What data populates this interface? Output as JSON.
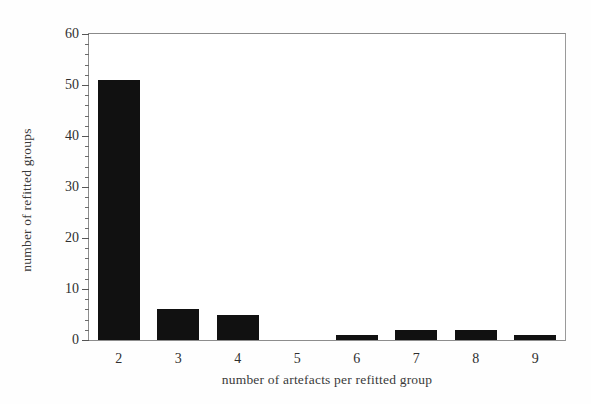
{
  "chart_data": {
    "type": "bar",
    "title": "",
    "subtitle": "",
    "xlabel": "number of artefacts per refitted group",
    "ylabel": "number of refitted groups",
    "categories": [
      "2",
      "3",
      "4",
      "5",
      "6",
      "7",
      "8",
      "9"
    ],
    "values": [
      51,
      6,
      5,
      0,
      1,
      2,
      2,
      1
    ],
    "ylim": [
      0,
      60
    ],
    "y_major_ticks": [
      "0",
      "10",
      "20",
      "30",
      "40",
      "50",
      "60"
    ],
    "y_minor_tick_interval": 2,
    "grid": false,
    "legend": null,
    "bar_color": "#111111",
    "frame_color": "#8d8d8d",
    "background_color": "#ffffff"
  },
  "axes": {
    "y": {
      "ticks": [
        {
          "label": "0",
          "value": 0
        },
        {
          "label": "10",
          "value": 10
        },
        {
          "label": "20",
          "value": 20
        },
        {
          "label": "30",
          "value": 30
        },
        {
          "label": "40",
          "value": 40
        },
        {
          "label": "50",
          "value": 50
        },
        {
          "label": "60",
          "value": 60
        }
      ]
    },
    "x": {
      "ticks": [
        {
          "label": "2"
        },
        {
          "label": "3"
        },
        {
          "label": "4"
        },
        {
          "label": "5"
        },
        {
          "label": "6"
        },
        {
          "label": "7"
        },
        {
          "label": "8"
        },
        {
          "label": "9"
        }
      ]
    }
  }
}
